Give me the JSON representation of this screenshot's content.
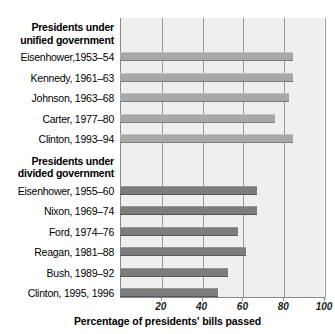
{
  "chart_data": {
    "type": "bar",
    "orientation": "horizontal",
    "title": "",
    "xlabel": "Percentage of presidents' bills passed",
    "ylabel": "",
    "xlim": [
      0,
      100
    ],
    "xticks": [
      20,
      40,
      60,
      80,
      100
    ],
    "xtick_labels": [
      "20",
      "40",
      "60",
      "80",
      "100"
    ],
    "grid": true,
    "grid_axis": "x",
    "legend": false,
    "groups": [
      {
        "name": "unified",
        "header": [
          "Presidents under",
          "unified government"
        ],
        "color": "#a8a8a8",
        "categories": [
          "Eisenhower,1953–54",
          "Kennedy, 1961–63",
          "Johnson, 1963–68",
          "Carter, 1977–80",
          "Clinton, 1993–94"
        ],
        "values": [
          85,
          85,
          83,
          76,
          85
        ]
      },
      {
        "name": "divided",
        "header": [
          "Presidents under",
          "divided government"
        ],
        "color": "#7d7d7d",
        "categories": [
          "Eisenhower, 1955–60",
          "Nixon, 1969–74",
          "Ford, 1974–76",
          "Reagan, 1981–88",
          "Bush, 1989–92",
          "Clinton, 1995, 1996"
        ],
        "values": [
          67,
          67,
          58,
          62,
          53,
          48
        ]
      }
    ]
  },
  "colors": {
    "plot_background": "#efefef",
    "gridline": "#9a9a9a",
    "axis": "#8a8a8a",
    "bar_light": "#a8a8a8",
    "bar_dark": "#7d7d7d",
    "text": "#000000"
  }
}
